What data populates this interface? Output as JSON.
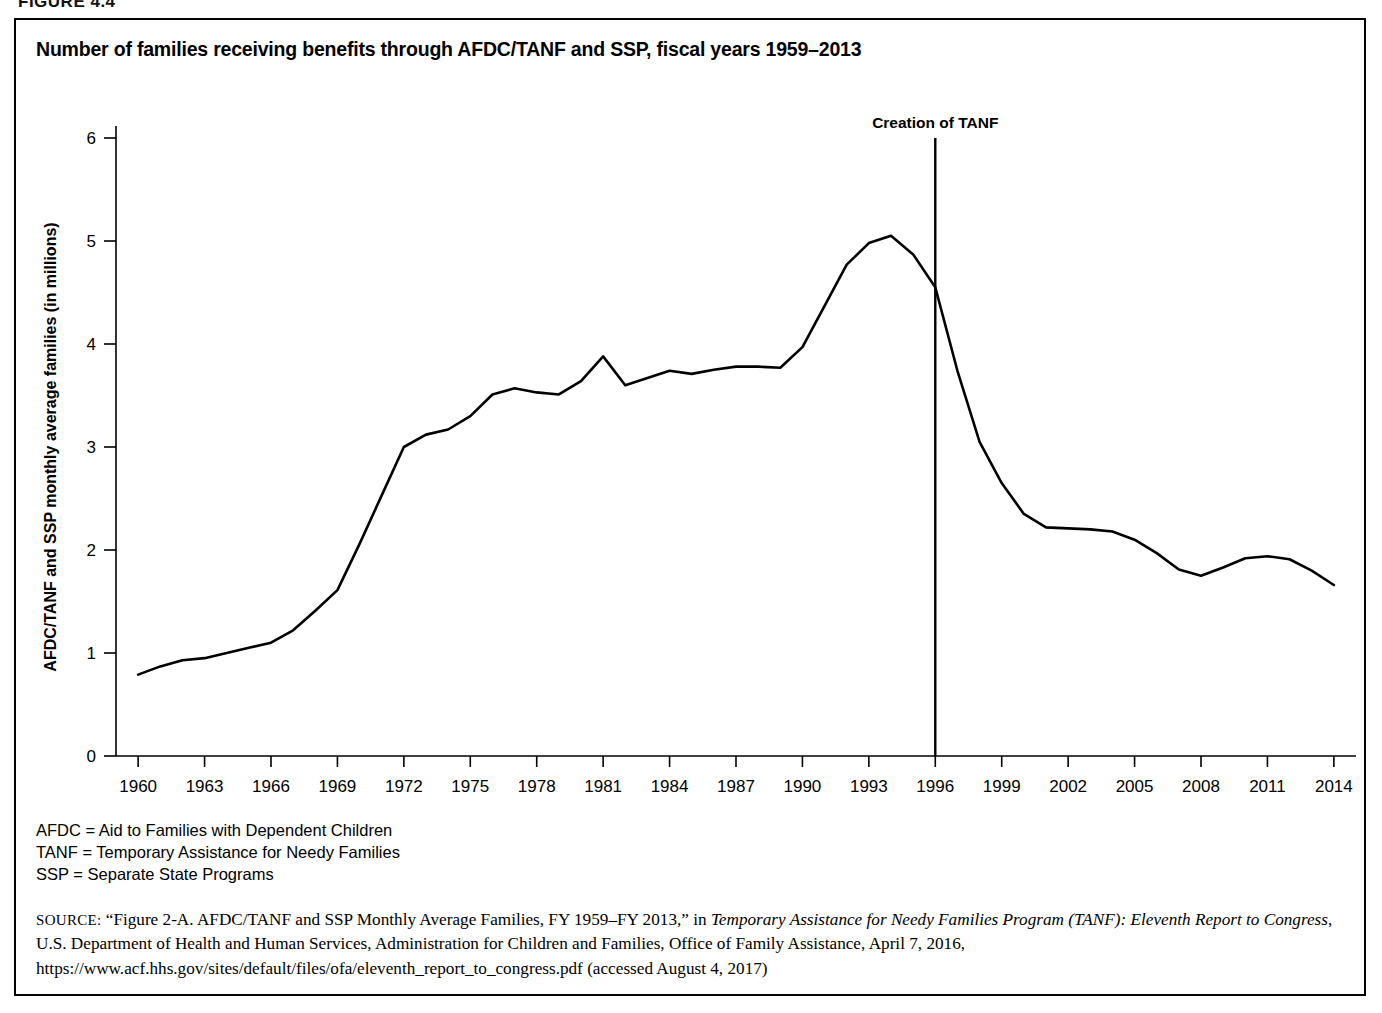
{
  "figure": {
    "tag": "FIGURE 4.4",
    "title": "Number of families receiving benefits through AFDC/TANF and SSP, fiscal years 1959–2013"
  },
  "abbreviations": [
    "AFDC = Aid to Families with Dependent Children",
    "TANF = Temporary Assistance for Needy Families",
    "SSP = Separate State Programs"
  ],
  "source": {
    "label": "SOURCE:",
    "part1": " “Figure 2-A. AFDC/TANF and SSP Monthly Average Families, FY 1959–FY 2013,” in ",
    "italic1": "Temporary Assistance for Needy Families Program (TANF): Eleventh Report to Congress",
    "part2": ", U.S. Department of Health and Human Services, Administration for Children and Families, Office of Family Assistance, April 7, 2016, https://www.acf.hhs.gov/sites/default/files/ofa/eleventh_report_to_congress.pdf (accessed August 4, 2017)"
  },
  "chart_data": {
    "type": "line",
    "title": "Number of families receiving benefits through AFDC/TANF and SSP, fiscal years 1959–2013",
    "xlabel": "Fiscal years",
    "ylabel": "AFDC/TANF and SSP monthly average families (in millions)",
    "xlim": [
      1959,
      2015
    ],
    "ylim": [
      0,
      6
    ],
    "ytick_labels": [
      "0",
      "1",
      "2",
      "3",
      "4",
      "5",
      "6"
    ],
    "yticks": [
      0,
      1,
      2,
      3,
      4,
      5,
      6
    ],
    "xtick_labels": [
      "1960",
      "1963",
      "1966",
      "1969",
      "1972",
      "1975",
      "1978",
      "1981",
      "1984",
      "1987",
      "1990",
      "1993",
      "1996",
      "1999",
      "2002",
      "2005",
      "2008",
      "2011",
      "2014"
    ],
    "xticks": [
      1960,
      1963,
      1966,
      1969,
      1972,
      1975,
      1978,
      1981,
      1984,
      1987,
      1990,
      1993,
      1996,
      1999,
      2002,
      2005,
      2008,
      2011,
      2014
    ],
    "grid": false,
    "legend": "none",
    "line_color": "#000000",
    "annotations": [
      {
        "label": "Creation of TANF",
        "x": 1996,
        "type": "vertical-line",
        "y_top": 6.0,
        "y_bottom": 0
      }
    ],
    "x": [
      1960,
      1961,
      1962,
      1963,
      1964,
      1965,
      1966,
      1967,
      1968,
      1969,
      1970,
      1971,
      1972,
      1973,
      1974,
      1975,
      1976,
      1977,
      1978,
      1979,
      1980,
      1981,
      1982,
      1983,
      1984,
      1985,
      1986,
      1987,
      1988,
      1989,
      1990,
      1991,
      1992,
      1993,
      1994,
      1995,
      1996,
      1997,
      1998,
      1999,
      2000,
      2001,
      2002,
      2003,
      2004,
      2005,
      2006,
      2007,
      2008,
      2009,
      2010,
      2011,
      2012,
      2013,
      2014
    ],
    "values": [
      0.79,
      0.87,
      0.93,
      0.95,
      1.0,
      1.05,
      1.1,
      1.22,
      1.41,
      1.61,
      2.06,
      2.53,
      3.0,
      3.12,
      3.17,
      3.3,
      3.51,
      3.57,
      3.53,
      3.51,
      3.64,
      3.88,
      3.6,
      3.67,
      3.74,
      3.71,
      3.75,
      3.78,
      3.78,
      3.77,
      3.97,
      4.37,
      4.77,
      4.98,
      5.05,
      4.87,
      4.55,
      3.74,
      3.05,
      2.65,
      2.35,
      2.22,
      2.21,
      2.2,
      2.18,
      2.1,
      1.97,
      1.81,
      1.75,
      1.83,
      1.92,
      1.94,
      1.91,
      1.8,
      1.66
    ]
  }
}
